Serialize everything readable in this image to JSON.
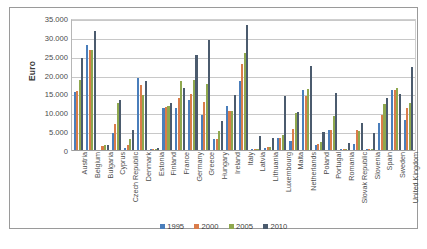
{
  "chart_data": {
    "type": "bar",
    "title": "",
    "xlabel": "",
    "ylabel": "Euro",
    "ylim": [
      0,
      35000
    ],
    "ytick_labels": [
      "0",
      "5.000",
      "10.000",
      "15.000",
      "20.000",
      "25.000",
      "30.000",
      "35.000"
    ],
    "ytick_values": [
      0,
      5000,
      10000,
      15000,
      20000,
      25000,
      30000,
      35000
    ],
    "grid": true,
    "legend_position": "bottom",
    "categories": [
      "Austria",
      "Belgium",
      "Bulgaria",
      "Cyprus",
      "Czech Republic",
      "Denmark",
      "Estonia",
      "Finland",
      "France",
      "Germany",
      "Greece",
      "Hungary",
      "Ireland",
      "Italy",
      "Latvia",
      "Lithuania",
      "Luxembourg",
      "Malta",
      "Netherlands",
      "Poland",
      "Portugal",
      "Romania",
      "Slovak Republic",
      "Slovenia",
      "Spain",
      "Sweden",
      "United Kingdom"
    ],
    "series": [
      {
        "name": "1995",
        "color": "#4A7EBB",
        "values": [
          15300,
          27800,
          0,
          4400,
          600,
          19200,
          150,
          11100,
          11100,
          13200,
          9300,
          2900,
          11800,
          18400,
          200,
          600,
          3100,
          2500,
          15800,
          1400,
          5200,
          200,
          1700,
          200,
          7100,
          15800,
          7900
        ]
      },
      {
        "name": "2000",
        "color": "#DA7C4A",
        "values": [
          15600,
          26600,
          1100,
          6900,
          1300,
          17200,
          250,
          11400,
          13700,
          14900,
          12800,
          2800,
          10400,
          22900,
          250,
          800,
          3300,
          5500,
          14300,
          1600,
          5400,
          300,
          5300,
          300,
          9400,
          15900,
          11100
        ]
      },
      {
        "name": "2005",
        "color": "#8FA84E",
        "values": [
          18500,
          26600,
          1200,
          12500,
          2900,
          14600,
          250,
          11600,
          18200,
          18500,
          17600,
          5000,
          10400,
          25700,
          350,
          900,
          4000,
          9900,
          16200,
          2200,
          8900,
          400,
          5000,
          300,
          12100,
          16500,
          12400
        ]
      },
      {
        "name": "2010",
        "color": "#4B5B6E",
        "values": [
          24400,
          31500,
          1300,
          13200,
          5300,
          18300,
          550,
          12400,
          16400,
          25300,
          29100,
          7800,
          14500,
          33200,
          3600,
          3200,
          14200,
          10200,
          22400,
          4900,
          15100,
          1800,
          7100,
          4500,
          13900,
          14900,
          21900
        ]
      }
    ],
    "caption": ""
  },
  "legend": {
    "items": [
      {
        "label": "1995",
        "color": "#4A7EBB"
      },
      {
        "label": "2000",
        "color": "#DA7C4A"
      },
      {
        "label": "2005",
        "color": "#8FA84E"
      },
      {
        "label": "2010",
        "color": "#4B5B6E"
      }
    ]
  },
  "axes": {
    "y_title": "Euro"
  }
}
